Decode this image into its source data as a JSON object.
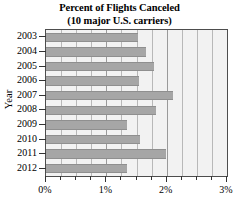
{
  "chart_data": {
    "type": "bar",
    "orientation": "horizontal",
    "title": "Percent of Flights Canceled",
    "subtitle": "(10 major U.S. carriers)",
    "xlabel": "",
    "ylabel": "Year",
    "categories": [
      "2003",
      "2004",
      "2005",
      "2006",
      "2007",
      "2008",
      "2009",
      "2010",
      "2011",
      "2012"
    ],
    "values": [
      1.53,
      1.66,
      1.79,
      1.54,
      2.1,
      1.82,
      1.34,
      1.56,
      1.99,
      1.34
    ],
    "xlim": [
      0,
      3
    ],
    "xtick_labels": [
      "0%",
      "1%",
      "2%",
      "3%"
    ],
    "xtick_values": [
      0,
      1,
      2,
      3
    ],
    "xminor_step": 0.25,
    "grid": true,
    "legend": null,
    "bar_color": "#a6a6a6",
    "plot_background": "#f2f2f2",
    "gridline_color": "#b8b8b8",
    "frame_color": "#4d4d4d"
  }
}
